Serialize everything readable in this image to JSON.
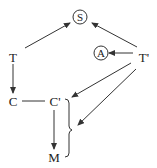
{
  "diagram": {
    "nodes": {
      "S": {
        "label": "S",
        "circled": true
      },
      "A": {
        "label": "A",
        "circled": true
      },
      "T": {
        "label": "T"
      },
      "T_prime": {
        "label": "T'"
      },
      "C": {
        "label": "C"
      },
      "C_prime": {
        "label": "C'"
      },
      "M": {
        "label": "M"
      }
    },
    "edges": [
      {
        "from": "T",
        "to": "S",
        "arrow": true
      },
      {
        "from": "T'",
        "to": "S",
        "arrow": true
      },
      {
        "from": "T'",
        "to": "A",
        "arrow": true
      },
      {
        "from": "T",
        "to": "C",
        "arrow": true
      },
      {
        "from": "C",
        "to": "C'",
        "arrow": false
      },
      {
        "from": "C'",
        "to": "M",
        "arrow": true
      },
      {
        "from": "T'",
        "to": "brace(C',M) top",
        "arrow": true
      },
      {
        "from": "T'",
        "to": "brace(C',M) middle",
        "arrow": true
      }
    ],
    "brace": {
      "groups": [
        "C'",
        "M"
      ]
    },
    "colors": {
      "ink": "#222222",
      "background": "#ffffff"
    }
  }
}
